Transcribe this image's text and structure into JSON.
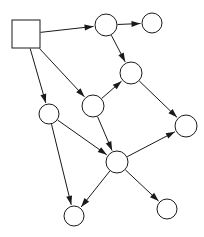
{
  "diagram": {
    "type": "directed-graph",
    "canvas": {
      "width": 204,
      "height": 237,
      "background": "#ffffff"
    },
    "style": {
      "stroke": "#1a1a1a",
      "fill": "#ffffff",
      "stroke_width": 1
    },
    "nodes": [
      {
        "id": "n1",
        "shape": "square",
        "label": "",
        "x": 26,
        "y": 34,
        "size": 28
      },
      {
        "id": "n2",
        "shape": "circle",
        "label": "",
        "x": 106,
        "y": 25,
        "r": 11
      },
      {
        "id": "n3",
        "shape": "circle",
        "label": "",
        "x": 152,
        "y": 23,
        "r": 10
      },
      {
        "id": "n4",
        "shape": "circle",
        "label": "",
        "x": 131,
        "y": 73,
        "r": 11
      },
      {
        "id": "n5",
        "shape": "circle",
        "label": "",
        "x": 93,
        "y": 106,
        "r": 11
      },
      {
        "id": "n6",
        "shape": "circle",
        "label": "",
        "x": 49,
        "y": 114,
        "r": 10
      },
      {
        "id": "n7",
        "shape": "circle",
        "label": "",
        "x": 186,
        "y": 126,
        "r": 11
      },
      {
        "id": "n8",
        "shape": "circle",
        "label": "",
        "x": 117,
        "y": 162,
        "r": 11
      },
      {
        "id": "n9",
        "shape": "circle",
        "label": "",
        "x": 74,
        "y": 216,
        "r": 10
      },
      {
        "id": "n10",
        "shape": "circle",
        "label": "",
        "x": 167,
        "y": 209,
        "r": 10
      }
    ],
    "edges": [
      {
        "id": "e1",
        "from": "n1",
        "to": "n2",
        "directed": true
      },
      {
        "id": "e2",
        "from": "n1",
        "to": "n6",
        "directed": true
      },
      {
        "id": "e3",
        "from": "n1",
        "to": "n5",
        "directed": true
      },
      {
        "id": "e4",
        "from": "n2",
        "to": "n3",
        "directed": true
      },
      {
        "id": "e5",
        "from": "n2",
        "to": "n4",
        "directed": true
      },
      {
        "id": "e6",
        "from": "n5",
        "to": "n4",
        "directed": true
      },
      {
        "id": "e7",
        "from": "n4",
        "to": "n7",
        "directed": true
      },
      {
        "id": "e8",
        "from": "n5",
        "to": "n8",
        "directed": true
      },
      {
        "id": "e9",
        "from": "n6",
        "to": "n8",
        "directed": true
      },
      {
        "id": "e10",
        "from": "n6",
        "to": "n9",
        "directed": true
      },
      {
        "id": "e11",
        "from": "n8",
        "to": "n7",
        "directed": true
      },
      {
        "id": "e12",
        "from": "n8",
        "to": "n9",
        "directed": true
      },
      {
        "id": "e13",
        "from": "n8",
        "to": "n10",
        "directed": true
      }
    ],
    "counts": {
      "nodes": 10,
      "edges": 13
    }
  }
}
